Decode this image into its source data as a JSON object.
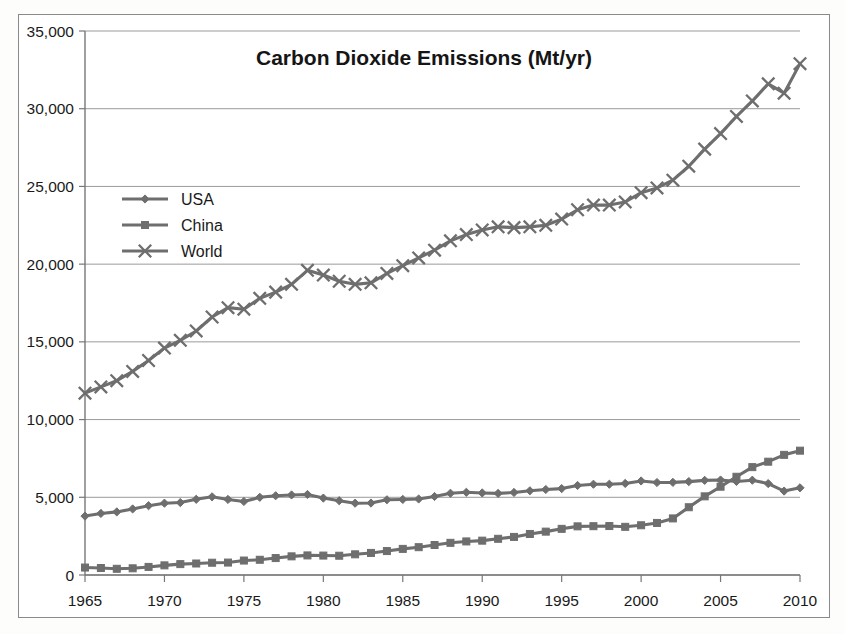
{
  "chart_data": {
    "type": "line",
    "title": "Carbon Dioxide Emissions (Mt/yr)",
    "xlabel": "",
    "ylabel": "",
    "xlim": [
      1965,
      2010
    ],
    "ylim": [
      0,
      35000
    ],
    "grid": true,
    "legend_position": "inside-upper-left",
    "x_tick_labels": [
      "1965",
      "1970",
      "1975",
      "1980",
      "1985",
      "1990",
      "1995",
      "2000",
      "2005",
      "2010"
    ],
    "x_ticks": [
      1965,
      1970,
      1975,
      1980,
      1985,
      1990,
      1995,
      2000,
      2005,
      2010
    ],
    "y_tick_labels": [
      "0",
      "5,000",
      "10,000",
      "15,000",
      "20,000",
      "25,000",
      "30,000",
      "35,000"
    ],
    "y_ticks": [
      0,
      5000,
      10000,
      15000,
      20000,
      25000,
      30000,
      35000
    ],
    "x": [
      1965,
      1966,
      1967,
      1968,
      1969,
      1970,
      1971,
      1972,
      1973,
      1974,
      1975,
      1976,
      1977,
      1978,
      1979,
      1980,
      1981,
      1982,
      1983,
      1984,
      1985,
      1986,
      1987,
      1988,
      1989,
      1990,
      1991,
      1992,
      1993,
      1994,
      1995,
      1996,
      1997,
      1998,
      1999,
      2000,
      2001,
      2002,
      2003,
      2004,
      2005,
      2006,
      2007,
      2008,
      2009,
      2010
    ],
    "series": [
      {
        "name": "USA",
        "marker": "diamond",
        "color": "#6e6e6e",
        "values": [
          3790,
          3960,
          4060,
          4250,
          4460,
          4620,
          4660,
          4870,
          5030,
          4860,
          4730,
          5000,
          5100,
          5150,
          5180,
          4950,
          4780,
          4620,
          4630,
          4840,
          4860,
          4890,
          5050,
          5260,
          5320,
          5280,
          5250,
          5310,
          5420,
          5500,
          5560,
          5760,
          5840,
          5840,
          5890,
          6050,
          5950,
          5960,
          6010,
          6090,
          6110,
          6020,
          6100,
          5880,
          5400,
          5610
        ]
      },
      {
        "name": "China",
        "marker": "square",
        "color": "#6e6e6e",
        "values": [
          480,
          450,
          400,
          430,
          520,
          620,
          700,
          740,
          790,
          800,
          930,
          980,
          1090,
          1200,
          1260,
          1250,
          1240,
          1330,
          1420,
          1540,
          1680,
          1790,
          1930,
          2070,
          2160,
          2210,
          2330,
          2450,
          2640,
          2790,
          2970,
          3130,
          3140,
          3150,
          3100,
          3200,
          3350,
          3640,
          4360,
          5060,
          5680,
          6320,
          6940,
          7290,
          7730,
          8000
        ]
      },
      {
        "name": "World",
        "marker": "x",
        "color": "#6e6e6e",
        "values": [
          11700,
          12100,
          12500,
          13100,
          13800,
          14600,
          15100,
          15700,
          16600,
          17200,
          17100,
          17800,
          18200,
          18700,
          19600,
          19300,
          18900,
          18700,
          18800,
          19400,
          19900,
          20400,
          20900,
          21500,
          21900,
          22200,
          22400,
          22350,
          22400,
          22500,
          22900,
          23500,
          23800,
          23800,
          24000,
          24600,
          24900,
          25400,
          26300,
          27400,
          28400,
          29500,
          30500,
          31600,
          31000,
          32900
        ]
      }
    ]
  },
  "legend": {
    "items": [
      {
        "label": "USA",
        "marker": "diamond"
      },
      {
        "label": "China",
        "marker": "square"
      },
      {
        "label": "World",
        "marker": "x"
      }
    ]
  }
}
